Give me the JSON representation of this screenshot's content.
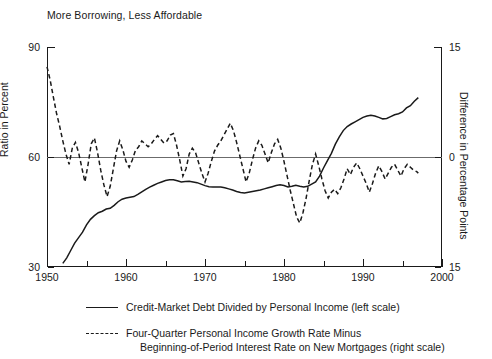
{
  "chart_data": {
    "type": "line",
    "title": "More Borrowing, Less Affordable",
    "xlabel": "",
    "ylabel": "Ratio in Percent",
    "y2label": "Difference in Percentage Points",
    "xlim": [
      1950,
      2000
    ],
    "ylim": [
      30,
      90
    ],
    "y2lim": [
      -15,
      15
    ],
    "grid": false,
    "legend_position": "bottom",
    "x_ticks_major": [
      1950,
      1960,
      1970,
      1980,
      1990,
      2000
    ],
    "x_ticks_minor": [
      1955,
      1965,
      1975,
      1985,
      1995
    ],
    "x_tick_labels": [
      "1950",
      "1960",
      "1970",
      "1980",
      "1990",
      "2000"
    ],
    "y_ticks": [
      30,
      60,
      90
    ],
    "y_tick_labels": [
      "30",
      "60",
      "90"
    ],
    "y2_ticks": [
      -15,
      0,
      15
    ],
    "y2_tick_labels": [
      "15",
      "0",
      "15"
    ],
    "zero_reference_line": 0,
    "series": [
      {
        "name": "Credit-Market Debt Divided by Personal Income (left scale)",
        "axis": "left",
        "style": "solid",
        "color": "#1a1a1a",
        "x": [
          1952.0,
          1952.5,
          1953.0,
          1953.5,
          1954.0,
          1954.5,
          1955.0,
          1955.5,
          1956.0,
          1956.5,
          1957.0,
          1957.5,
          1958.0,
          1958.5,
          1959.0,
          1959.5,
          1960.0,
          1960.5,
          1961.0,
          1961.5,
          1962.0,
          1962.5,
          1963.0,
          1963.5,
          1964.0,
          1964.5,
          1965.0,
          1965.5,
          1966.0,
          1966.5,
          1967.0,
          1967.5,
          1968.0,
          1968.5,
          1969.0,
          1969.5,
          1970.0,
          1970.5,
          1971.0,
          1971.5,
          1972.0,
          1972.5,
          1973.0,
          1973.5,
          1974.0,
          1974.5,
          1975.0,
          1975.5,
          1976.0,
          1976.5,
          1977.0,
          1977.5,
          1978.0,
          1978.5,
          1979.0,
          1979.5,
          1980.0,
          1980.5,
          1981.0,
          1981.5,
          1982.0,
          1982.5,
          1983.0,
          1983.5,
          1984.0,
          1984.5,
          1985.0,
          1985.5,
          1986.0,
          1986.5,
          1987.0,
          1987.5,
          1988.0,
          1988.5,
          1989.0,
          1989.5,
          1990.0,
          1990.5,
          1991.0,
          1991.5,
          1992.0,
          1992.5,
          1993.0,
          1993.5,
          1994.0,
          1994.5,
          1995.0,
          1995.5,
          1996.0,
          1996.5,
          1997.0
        ],
        "y": [
          31.0,
          32.5,
          34.5,
          36.5,
          38.0,
          39.5,
          41.5,
          43.0,
          44.0,
          44.8,
          45.2,
          45.8,
          46.0,
          46.8,
          47.8,
          48.5,
          48.8,
          49.0,
          49.2,
          49.8,
          50.5,
          51.2,
          51.8,
          52.3,
          52.8,
          53.2,
          53.6,
          53.8,
          53.8,
          53.5,
          53.2,
          53.3,
          53.4,
          53.2,
          53.0,
          52.6,
          52.2,
          51.9,
          51.8,
          51.8,
          51.8,
          51.6,
          51.3,
          51.0,
          50.6,
          50.3,
          50.2,
          50.4,
          50.6,
          50.8,
          51.0,
          51.3,
          51.6,
          51.9,
          52.2,
          52.4,
          52.2,
          51.8,
          52.0,
          52.3,
          52.0,
          51.8,
          52.0,
          52.6,
          53.2,
          54.8,
          57.0,
          59.0,
          61.0,
          63.5,
          65.5,
          67.2,
          68.3,
          69.0,
          69.6,
          70.2,
          70.8,
          71.2,
          71.4,
          71.2,
          70.8,
          70.4,
          70.5,
          71.0,
          71.5,
          71.8,
          72.3,
          73.4,
          74.0,
          75.2,
          76.2
        ]
      },
      {
        "name": "Four-Quarter Personal Income Growth Rate Minus Beginning-of-Period Interest Rate on New Mortgages (right scale)",
        "axis": "right",
        "style": "dashed",
        "color": "#1a1a1a",
        "x": [
          1950.0,
          1950.4,
          1950.8,
          1951.2,
          1951.6,
          1952.0,
          1952.4,
          1952.8,
          1953.2,
          1953.6,
          1954.0,
          1954.4,
          1954.8,
          1955.2,
          1955.6,
          1956.0,
          1956.4,
          1956.8,
          1957.2,
          1957.6,
          1958.0,
          1958.4,
          1958.8,
          1959.2,
          1959.6,
          1960.0,
          1960.4,
          1960.8,
          1961.2,
          1961.6,
          1962.0,
          1962.4,
          1962.8,
          1963.2,
          1963.6,
          1964.0,
          1964.4,
          1964.8,
          1965.2,
          1965.6,
          1966.0,
          1966.4,
          1966.8,
          1967.2,
          1967.6,
          1968.0,
          1968.4,
          1968.8,
          1969.2,
          1969.6,
          1970.0,
          1970.4,
          1970.8,
          1971.2,
          1971.6,
          1972.0,
          1972.4,
          1972.8,
          1973.2,
          1973.6,
          1974.0,
          1974.4,
          1974.8,
          1975.2,
          1975.6,
          1976.0,
          1976.4,
          1976.8,
          1977.2,
          1977.6,
          1978.0,
          1978.4,
          1978.8,
          1979.2,
          1979.6,
          1980.0,
          1980.4,
          1980.8,
          1981.2,
          1981.6,
          1982.0,
          1982.4,
          1982.8,
          1983.2,
          1983.6,
          1984.0,
          1984.4,
          1984.8,
          1985.2,
          1985.6,
          1986.0,
          1986.4,
          1986.8,
          1987.2,
          1987.6,
          1988.0,
          1988.4,
          1988.8,
          1989.2,
          1989.6,
          1990.0,
          1990.4,
          1990.8,
          1991.2,
          1991.6,
          1992.0,
          1992.4,
          1992.8,
          1993.2,
          1993.6,
          1994.0,
          1994.4,
          1994.8,
          1995.2,
          1995.6,
          1996.0,
          1996.4,
          1996.8,
          1997.0
        ],
        "y": [
          12.3,
          10.5,
          8.2,
          6.0,
          4.2,
          2.2,
          0.4,
          -1.0,
          1.2,
          2.0,
          0.6,
          -1.4,
          -3.4,
          -1.0,
          1.8,
          2.6,
          0.6,
          -1.8,
          -3.8,
          -5.4,
          -4.0,
          -1.6,
          0.8,
          2.2,
          1.0,
          -0.6,
          -1.4,
          -0.4,
          0.9,
          1.4,
          2.2,
          1.8,
          1.4,
          1.8,
          2.4,
          2.9,
          2.4,
          1.9,
          2.2,
          3.0,
          3.2,
          1.6,
          -0.4,
          -2.6,
          -1.6,
          0.4,
          1.2,
          0.6,
          -0.8,
          -2.2,
          -3.4,
          -2.2,
          -0.6,
          0.8,
          1.6,
          2.2,
          3.0,
          3.8,
          4.6,
          3.6,
          2.0,
          0.2,
          -1.6,
          -3.4,
          -2.2,
          -0.4,
          1.2,
          2.2,
          1.6,
          0.4,
          -0.8,
          0.6,
          1.8,
          2.4,
          1.2,
          -0.6,
          -2.6,
          -4.6,
          -6.4,
          -8.2,
          -9.0,
          -7.6,
          -5.6,
          -3.2,
          -1.0,
          0.4,
          -1.2,
          -3.0,
          -4.6,
          -5.6,
          -4.8,
          -4.4,
          -5.0,
          -4.2,
          -3.0,
          -1.6,
          -2.4,
          -1.4,
          -0.8,
          -1.6,
          -2.6,
          -3.6,
          -4.8,
          -3.6,
          -2.2,
          -1.2,
          -2.0,
          -3.0,
          -2.2,
          -1.4,
          -1.0,
          -1.8,
          -2.6,
          -1.6,
          -1.0,
          -1.4,
          -1.8,
          -2.0,
          -2.2
        ]
      }
    ]
  },
  "legend": {
    "items": [
      {
        "style": "solid",
        "line1": "Credit-Market Debt Divided by Personal Income (left scale)",
        "line2": ""
      },
      {
        "style": "dashed",
        "line1": "Four-Quarter Personal Income Growth Rate Minus",
        "line2": "Beginning-of-Period Interest Rate on New Mortgages (right scale)"
      }
    ]
  }
}
